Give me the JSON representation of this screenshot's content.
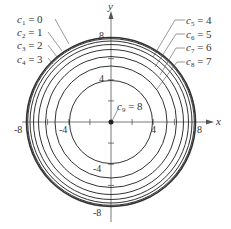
{
  "figure": {
    "axes": {
      "x_label": "x",
      "y_label": "y",
      "x_ticks": [
        "-8",
        "-4",
        "4",
        "8"
      ],
      "y_ticks": [
        "8",
        "4",
        "-4",
        "-8"
      ],
      "range": [
        -8,
        8
      ]
    },
    "level_curves": [
      {
        "name": "c1",
        "sub": "1",
        "value": "0",
        "radius": 8.0
      },
      {
        "name": "c2",
        "sub": "2",
        "value": "1",
        "radius": 7.94
      },
      {
        "name": "c3",
        "sub": "3",
        "value": "2",
        "radius": 7.75
      },
      {
        "name": "c4",
        "sub": "4",
        "value": "3",
        "radius": 7.42
      },
      {
        "name": "c5",
        "sub": "5",
        "value": "4",
        "radius": 6.93
      },
      {
        "name": "c6",
        "sub": "6",
        "value": "5",
        "radius": 6.24
      },
      {
        "name": "c7",
        "sub": "7",
        "value": "6",
        "radius": 5.29
      },
      {
        "name": "c8",
        "sub": "8",
        "value": "7",
        "radius": 3.87
      },
      {
        "name": "c9",
        "sub": "9",
        "value": "8",
        "radius": 0
      }
    ],
    "colors": {
      "curve": "#333333",
      "axis": "#555555",
      "text": "#333333"
    }
  }
}
